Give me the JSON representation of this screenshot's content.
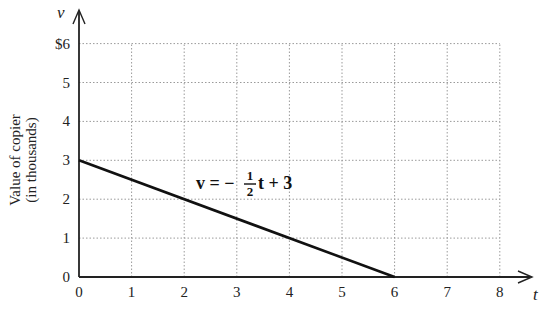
{
  "chart_data": {
    "type": "line",
    "title": "",
    "xlabel": "t",
    "ylabel": "Value of copier (in thousands)",
    "y_axis_var": "v",
    "xlim": [
      0,
      8
    ],
    "ylim": [
      0,
      6
    ],
    "x_ticks": [
      "0",
      "1",
      "2",
      "3",
      "4",
      "5",
      "6",
      "7",
      "8"
    ],
    "y_ticks": [
      "0",
      "1",
      "2",
      "3",
      "4",
      "5",
      "$6"
    ],
    "grid": true,
    "series": [
      {
        "name": "v = -1/2 t + 3",
        "x": [
          0,
          6
        ],
        "y": [
          3,
          0
        ]
      }
    ],
    "annotations": [
      {
        "text": "v = −½t + 3",
        "x": 3.4,
        "y": 2.3
      }
    ]
  },
  "labels": {
    "y_var": "v",
    "x_var": "t",
    "ylabel_line1": "Value of copier",
    "ylabel_line2": "(in thousands)",
    "eq_lhs": "v = −",
    "eq_num": "1",
    "eq_den": "2",
    "eq_rhs": "t + 3"
  }
}
